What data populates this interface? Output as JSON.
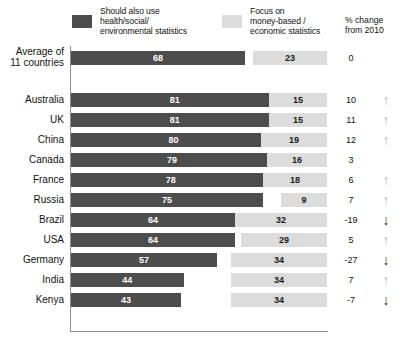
{
  "legend": {
    "series_dark": {
      "swatch_color": "#4d4d4d",
      "line1": "Should also use",
      "line2": "health/social/",
      "line3": "environmental statistics"
    },
    "series_light": {
      "swatch_color": "#dcdcdc",
      "line1": "Focus on",
      "line2": "money-based /",
      "line3": "economic statistics"
    },
    "change_header": {
      "line1": "% change",
      "line2": "from 2010"
    }
  },
  "chart_data": {
    "type": "bar",
    "title": "",
    "subtitle": "",
    "xlabel": "",
    "ylabel": "",
    "xlim": [
      0,
      100
    ],
    "grid": false,
    "legend_position": "top",
    "orientation": "horizontal",
    "categories": [
      "Average of\n11 countries",
      "Australia",
      "UK",
      "China",
      "Canada",
      "France",
      "Russia",
      "Brazil",
      "USA",
      "Germany",
      "India",
      "Kenya"
    ],
    "series": [
      {
        "name": "Should also use health/social/environmental statistics",
        "color": "#4d4d4d",
        "values": [
          68,
          81,
          81,
          80,
          79,
          78,
          75,
          64,
          64,
          57,
          44,
          43
        ]
      },
      {
        "name": "Focus on money-based / economic statistics",
        "color": "#dcdcdc",
        "values": [
          23,
          15,
          15,
          19,
          16,
          18,
          9,
          32,
          29,
          34,
          34,
          34
        ]
      }
    ],
    "annotations": {
      "name": "% change from 2010",
      "values": [
        0,
        10,
        11,
        12,
        3,
        6,
        7,
        -19,
        5,
        -27,
        7,
        -7
      ],
      "arrows": [
        "none",
        "up",
        "up",
        "up",
        "none",
        "up",
        "up",
        "down",
        "up",
        "down",
        "up",
        "down"
      ]
    }
  },
  "rows": [
    {
      "label": "Average of",
      "label2": "11 countries",
      "dark": 68,
      "light": 23,
      "pct": "0",
      "arrow": "none",
      "spacer": true
    },
    {
      "label": "Australia",
      "label2": "",
      "dark": 81,
      "light": 15,
      "pct": "10",
      "arrow": "up"
    },
    {
      "label": "UK",
      "label2": "",
      "dark": 81,
      "light": 15,
      "pct": "11",
      "arrow": "up"
    },
    {
      "label": "China",
      "label2": "",
      "dark": 80,
      "light": 19,
      "pct": "12",
      "arrow": "up"
    },
    {
      "label": "Canada",
      "label2": "",
      "dark": 79,
      "light": 16,
      "pct": "3",
      "arrow": "none"
    },
    {
      "label": "France",
      "label2": "",
      "dark": 78,
      "light": 18,
      "pct": "6",
      "arrow": "up"
    },
    {
      "label": "Russia",
      "label2": "",
      "dark": 75,
      "light": 9,
      "pct": "7",
      "arrow": "up"
    },
    {
      "label": "Brazil",
      "label2": "",
      "dark": 64,
      "light": 32,
      "pct": "-19",
      "arrow": "down"
    },
    {
      "label": "USA",
      "label2": "",
      "dark": 64,
      "light": 29,
      "pct": "5",
      "arrow": "up"
    },
    {
      "label": "Germany",
      "label2": "",
      "dark": 57,
      "light": 34,
      "pct": "-27",
      "arrow": "down"
    },
    {
      "label": "India",
      "label2": "",
      "dark": 44,
      "light": 34,
      "pct": "7",
      "arrow": "up"
    },
    {
      "label": "Kenya",
      "label2": "",
      "dark": 43,
      "light": 34,
      "pct": "-7",
      "arrow": "down"
    }
  ],
  "glyphs": {
    "arrow_up": "↑",
    "arrow_down": "↓"
  }
}
